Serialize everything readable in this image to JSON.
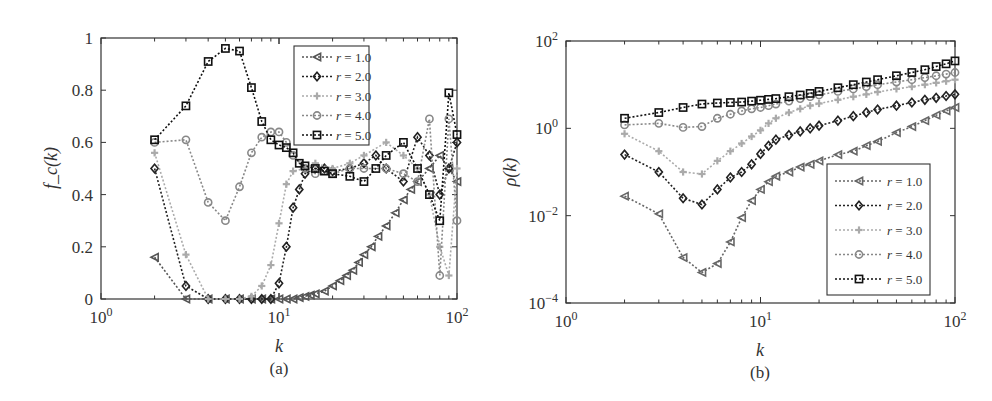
{
  "chart_data": [
    {
      "id": "a",
      "type": "line",
      "caption": "(a)",
      "xlabel": "k",
      "ylabel": "f_c(k)",
      "xscale": "log",
      "yscale": "linear",
      "xlim": [
        1,
        100
      ],
      "ylim": [
        0,
        1
      ],
      "xticks": [
        "10^0",
        "10^1",
        "10^2"
      ],
      "yticks": [
        "0",
        "0.2",
        "0.4",
        "0.6",
        "0.8",
        "1"
      ],
      "grid": false,
      "legend_position": "upper right",
      "series": [
        {
          "name": "r = 1.0",
          "marker": "triangle-left",
          "color": "#555555",
          "x": [
            2,
            3,
            4,
            5,
            6,
            7,
            8,
            9,
            10,
            11,
            12,
            13,
            14,
            15,
            16,
            18,
            20,
            22,
            24,
            26,
            28,
            30,
            33,
            36,
            40,
            45,
            50,
            55,
            60,
            70,
            80,
            90,
            100
          ],
          "y": [
            0.16,
            0.0,
            0.0,
            0.0,
            0.0,
            0.0,
            0.0,
            0.0,
            0.0,
            0.0,
            0.0,
            0.005,
            0.01,
            0.015,
            0.02,
            0.03,
            0.05,
            0.07,
            0.09,
            0.11,
            0.14,
            0.17,
            0.2,
            0.24,
            0.28,
            0.33,
            0.38,
            0.42,
            0.45,
            0.5,
            0.55,
            0.5,
            0.45
          ]
        },
        {
          "name": "r = 2.0",
          "marker": "diamond",
          "color": "#222222",
          "x": [
            2,
            3,
            4,
            5,
            6,
            7,
            8,
            9,
            10,
            11,
            12,
            13,
            14,
            16,
            18,
            20,
            25,
            30,
            35,
            40,
            50,
            60,
            70,
            80,
            90,
            100
          ],
          "y": [
            0.5,
            0.05,
            0.0,
            0.0,
            0.0,
            0.0,
            0.0,
            0.0,
            0.06,
            0.2,
            0.35,
            0.42,
            0.48,
            0.5,
            0.5,
            0.49,
            0.5,
            0.52,
            0.55,
            0.5,
            0.45,
            0.62,
            0.55,
            0.4,
            0.5,
            0.6
          ]
        },
        {
          "name": "r = 3.0",
          "marker": "plus",
          "color": "#aaaaaa",
          "x": [
            2,
            3,
            4,
            5,
            6,
            7,
            8,
            9,
            10,
            11,
            12,
            14,
            16,
            20,
            25,
            30,
            40,
            50,
            60,
            70,
            80,
            90,
            100
          ],
          "y": [
            0.56,
            0.17,
            0.0,
            0.0,
            0.0,
            0.01,
            0.05,
            0.13,
            0.29,
            0.44,
            0.49,
            0.5,
            0.52,
            0.5,
            0.52,
            0.55,
            0.6,
            0.55,
            0.5,
            0.4,
            0.2,
            0.09,
            0.5
          ]
        },
        {
          "name": "r = 4.0",
          "marker": "circle",
          "color": "#888888",
          "x": [
            2,
            3,
            4,
            5,
            6,
            7,
            8,
            9,
            10,
            11,
            12,
            14,
            16,
            20,
            25,
            30,
            40,
            50,
            60,
            70,
            80,
            90,
            100
          ],
          "y": [
            0.6,
            0.61,
            0.37,
            0.3,
            0.43,
            0.56,
            0.62,
            0.64,
            0.64,
            0.6,
            0.55,
            0.5,
            0.48,
            0.48,
            0.5,
            0.5,
            0.5,
            0.48,
            0.45,
            0.69,
            0.09,
            0.69,
            0.3
          ]
        },
        {
          "name": "r = 5.0",
          "marker": "square",
          "color": "#111111",
          "x": [
            2,
            3,
            4,
            5,
            6,
            7,
            8,
            9,
            10,
            11,
            12,
            13,
            14,
            16,
            18,
            20,
            25,
            30,
            35,
            40,
            50,
            60,
            70,
            80,
            90,
            100
          ],
          "y": [
            0.61,
            0.74,
            0.91,
            0.96,
            0.95,
            0.81,
            0.68,
            0.61,
            0.59,
            0.58,
            0.56,
            0.52,
            0.51,
            0.5,
            0.49,
            0.48,
            0.47,
            0.45,
            0.5,
            0.55,
            0.6,
            0.5,
            0.4,
            0.3,
            0.79,
            0.63
          ]
        }
      ]
    },
    {
      "id": "b",
      "type": "line",
      "caption": "(b)",
      "xlabel": "k",
      "ylabel": "ρ(k)",
      "xscale": "log",
      "yscale": "log",
      "xlim": [
        1,
        100
      ],
      "ylim": [
        0.0001,
        100
      ],
      "xticks": [
        "10^0",
        "10^1",
        "10^2"
      ],
      "yticks": [
        "10^-4",
        "10^-2",
        "10^0",
        "10^2"
      ],
      "grid": false,
      "legend_position": "lower right",
      "series": [
        {
          "name": "r = 1.0",
          "marker": "triangle-left",
          "color": "#666666",
          "x": [
            2,
            3,
            4,
            5,
            6,
            7,
            8,
            9,
            10,
            11,
            12,
            14,
            16,
            18,
            20,
            25,
            30,
            35,
            40,
            50,
            60,
            70,
            80,
            90,
            100
          ],
          "y": [
            0.028,
            0.011,
            0.0011,
            0.0005,
            0.0008,
            0.0025,
            0.009,
            0.022,
            0.04,
            0.06,
            0.08,
            0.1,
            0.13,
            0.15,
            0.18,
            0.25,
            0.3,
            0.4,
            0.5,
            0.8,
            1.1,
            1.5,
            2.0,
            2.5,
            3.0
          ]
        },
        {
          "name": "r = 2.0",
          "marker": "diamond",
          "color": "#222222",
          "x": [
            2,
            3,
            4,
            5,
            6,
            7,
            8,
            9,
            10,
            11,
            12,
            14,
            16,
            18,
            20,
            25,
            30,
            35,
            40,
            50,
            60,
            70,
            80,
            90,
            100
          ],
          "y": [
            0.25,
            0.1,
            0.025,
            0.018,
            0.04,
            0.075,
            0.1,
            0.15,
            0.26,
            0.4,
            0.55,
            0.7,
            0.85,
            1.0,
            1.15,
            1.5,
            1.9,
            2.3,
            2.7,
            3.3,
            3.9,
            4.5,
            5.0,
            5.5,
            6.0
          ]
        },
        {
          "name": "r = 3.0",
          "marker": "plus",
          "color": "#aaaaaa",
          "x": [
            2,
            3,
            4,
            5,
            6,
            7,
            8,
            9,
            10,
            11,
            12,
            14,
            16,
            18,
            20,
            25,
            30,
            35,
            40,
            50,
            60,
            70,
            80,
            90,
            100
          ],
          "y": [
            0.75,
            0.3,
            0.1,
            0.09,
            0.18,
            0.3,
            0.45,
            0.65,
            0.9,
            1.3,
            1.7,
            2.3,
            2.8,
            3.3,
            3.7,
            4.5,
            5.3,
            6.0,
            6.8,
            8.0,
            9.0,
            10.0,
            11.0,
            12.0,
            13.0
          ]
        },
        {
          "name": "r = 4.0",
          "marker": "circle",
          "color": "#888888",
          "x": [
            2,
            3,
            4,
            5,
            6,
            7,
            8,
            9,
            10,
            11,
            12,
            14,
            16,
            18,
            20,
            25,
            30,
            35,
            40,
            50,
            60,
            70,
            80,
            90,
            100
          ],
          "y": [
            1.2,
            1.3,
            1.05,
            1.1,
            1.7,
            2.1,
            2.5,
            2.8,
            3.0,
            3.3,
            3.6,
            4.2,
            4.8,
            5.3,
            5.8,
            7.0,
            8.0,
            9.0,
            10.0,
            11.5,
            13.0,
            14.5,
            16.0,
            17.5,
            19.0
          ]
        },
        {
          "name": "r = 5.0",
          "marker": "square",
          "color": "#111111",
          "x": [
            2,
            3,
            4,
            5,
            6,
            7,
            8,
            9,
            10,
            11,
            12,
            14,
            16,
            18,
            20,
            25,
            30,
            35,
            40,
            50,
            60,
            70,
            80,
            90,
            100
          ],
          "y": [
            1.7,
            2.3,
            3.0,
            3.6,
            3.8,
            3.9,
            4.0,
            4.2,
            4.4,
            4.6,
            4.8,
            5.3,
            5.8,
            6.3,
            7.0,
            8.5,
            10.0,
            11.5,
            13.0,
            16.0,
            19.0,
            22.0,
            26.0,
            30.0,
            35.0
          ]
        }
      ]
    }
  ]
}
